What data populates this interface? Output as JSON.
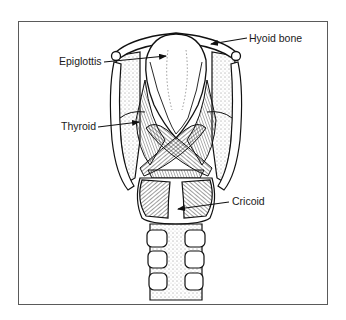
{
  "figure": {
    "labels": [
      {
        "id": "hyoid",
        "text": "Hyoid bone"
      },
      {
        "id": "epiglottis",
        "text": "Epiglottis"
      },
      {
        "id": "thyroid",
        "text": "Thyroid"
      },
      {
        "id": "cricoid",
        "text": "Cricoid"
      }
    ],
    "colors": {
      "ink": "#1a1a1a",
      "frame": "#5a5a5a",
      "background": "#ffffff"
    }
  }
}
